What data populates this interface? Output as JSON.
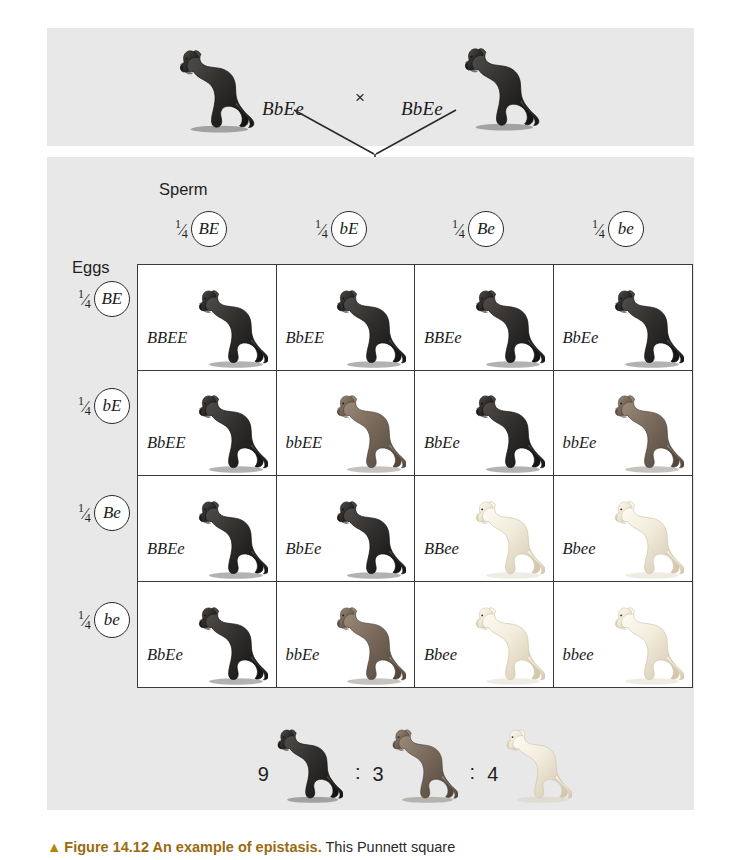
{
  "colors": {
    "panel_bg": "#e8e8e8",
    "grid_line": "#3a3a3a",
    "black_coat": "#32302e",
    "brown_coat": "#7a6a5c",
    "yellow_coat": "#f2ecdd",
    "caption_accent": "#9a6a10"
  },
  "parents": {
    "left_genotype": "BbEe",
    "right_genotype": "BbEe",
    "cross_symbol": "×"
  },
  "axes": {
    "sperm_heading": "Sperm",
    "eggs_heading": "Eggs"
  },
  "sperm_gametes": [
    {
      "fraction_numerator": "1",
      "fraction_denominator": "4",
      "allele": "BE"
    },
    {
      "fraction_numerator": "1",
      "fraction_denominator": "4",
      "allele": "bE"
    },
    {
      "fraction_numerator": "1",
      "fraction_denominator": "4",
      "allele": "Be"
    },
    {
      "fraction_numerator": "1",
      "fraction_denominator": "4",
      "allele": "be"
    }
  ],
  "egg_gametes": [
    {
      "fraction_numerator": "1",
      "fraction_denominator": "4",
      "allele": "BE"
    },
    {
      "fraction_numerator": "1",
      "fraction_denominator": "4",
      "allele": "bE"
    },
    {
      "fraction_numerator": "1",
      "fraction_denominator": "4",
      "allele": "Be"
    },
    {
      "fraction_numerator": "1",
      "fraction_denominator": "4",
      "allele": "be"
    }
  ],
  "punnett_cells": [
    {
      "genotype": "BBEE",
      "coat": "black"
    },
    {
      "genotype": "BbEE",
      "coat": "black"
    },
    {
      "genotype": "BBEe",
      "coat": "black"
    },
    {
      "genotype": "BbEe",
      "coat": "black"
    },
    {
      "genotype": "BbEE",
      "coat": "black"
    },
    {
      "genotype": "bbEE",
      "coat": "brown"
    },
    {
      "genotype": "BbEe",
      "coat": "black"
    },
    {
      "genotype": "bbEe",
      "coat": "brown"
    },
    {
      "genotype": "BBEe",
      "coat": "black"
    },
    {
      "genotype": "BbEe",
      "coat": "black"
    },
    {
      "genotype": "BBee",
      "coat": "yellow"
    },
    {
      "genotype": "Bbee",
      "coat": "yellow"
    },
    {
      "genotype": "BbEe",
      "coat": "black"
    },
    {
      "genotype": "bbEe",
      "coat": "brown"
    },
    {
      "genotype": "Bbee",
      "coat": "yellow"
    },
    {
      "genotype": "bbee",
      "coat": "yellow"
    }
  ],
  "ratio": {
    "separator": ":",
    "groups": [
      {
        "count": "9",
        "coat": "black"
      },
      {
        "count": "3",
        "coat": "brown"
      },
      {
        "count": "4",
        "coat": "yellow"
      }
    ]
  },
  "caption": {
    "marker": "▲",
    "title": "Figure 14.12 An example of epistasis.",
    "body": "This Punnett square"
  }
}
